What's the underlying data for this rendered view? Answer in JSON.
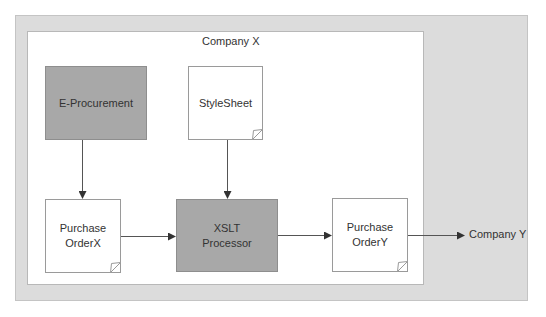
{
  "diagram": {
    "outer_region": {
      "label": ""
    },
    "inner_region": {
      "label": "Company X"
    },
    "nodes": {
      "eprocurement": {
        "label": "E-Procurement",
        "shape": "process",
        "fill": "#a8a8a8"
      },
      "stylesheet": {
        "label": "StyleSheet",
        "shape": "document",
        "fill": "#ffffff"
      },
      "po_x": {
        "line1": "Purchase",
        "line2": "OrderX",
        "shape": "document",
        "fill": "#ffffff"
      },
      "xslt": {
        "line1": "XSLT",
        "line2": "Processor",
        "shape": "process",
        "fill": "#a8a8a8"
      },
      "po_y": {
        "line1": "Purchase",
        "line2": "OrderY",
        "shape": "document",
        "fill": "#ffffff"
      }
    },
    "external": {
      "company_y": {
        "label": "Company Y"
      }
    },
    "edges": [
      {
        "from": "E-Procurement",
        "to": "Purchase OrderX"
      },
      {
        "from": "StyleSheet",
        "to": "XSLT Processor"
      },
      {
        "from": "Purchase OrderX",
        "to": "XSLT Processor"
      },
      {
        "from": "XSLT Processor",
        "to": "Purchase OrderY"
      },
      {
        "from": "Purchase OrderY",
        "to": "Company Y"
      }
    ],
    "colors": {
      "outer_bg": "#dcdcdc",
      "process_fill": "#a8a8a8",
      "line": "#555555"
    }
  }
}
